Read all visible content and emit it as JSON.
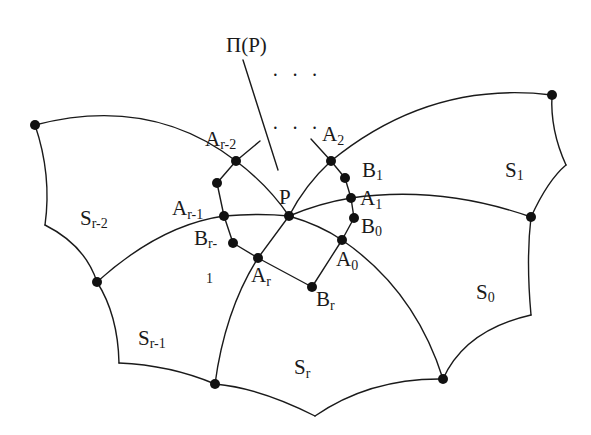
{
  "figure": {
    "pointer_label": "Π(P)",
    "ellipsis_top": "· · ·",
    "ellipsis_mid": "· · ·",
    "center_label": "P",
    "vertex_labels": {
      "A_r_minus_2": {
        "main": "A",
        "sub": "r-2"
      },
      "A_2": {
        "main": "A",
        "sub": "2"
      },
      "B_1": {
        "main": "B",
        "sub": "1"
      },
      "A_1": {
        "main": "A",
        "sub": "1"
      },
      "B_0": {
        "main": "B",
        "sub": "0"
      },
      "A_0": {
        "main": "A",
        "sub": "0"
      },
      "A_r_minus_1": {
        "main": "A",
        "sub": "r-1"
      },
      "B_r_minus_1": {
        "main": "B",
        "sub": "r-",
        "stray": "1"
      },
      "A_r": {
        "main": "A",
        "sub": "r"
      },
      "B_r": {
        "main": "B",
        "sub": "r"
      }
    },
    "region_labels": {
      "S_r_minus_2": {
        "main": "S",
        "sub": "r-2"
      },
      "S_1": {
        "main": "S",
        "sub": "1"
      },
      "S_0": {
        "main": "S",
        "sub": "0"
      },
      "S_r_minus_1": {
        "main": "S",
        "sub": "r-1"
      },
      "S_r": {
        "main": "S",
        "sub": "r"
      }
    }
  }
}
